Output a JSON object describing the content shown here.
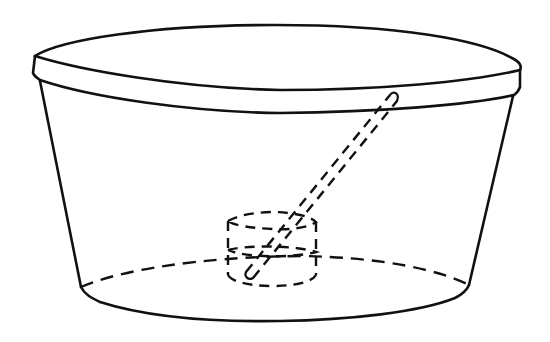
{
  "figure": {
    "description": "Line drawing of a transparent tapered tub with a lid, a small cylinder resting on the bottom, and a rod leaning diagonally from the cylinder up to the rim",
    "colors": {
      "background": "#ffffff",
      "stroke": "#111111"
    },
    "components": [
      {
        "name": "lid",
        "style": "solid"
      },
      {
        "name": "tub-walls",
        "style": "solid"
      },
      {
        "name": "tub-bottom-front",
        "style": "solid"
      },
      {
        "name": "tub-bottom-back",
        "style": "dashed"
      },
      {
        "name": "inner-cylinder",
        "style": "dashed"
      },
      {
        "name": "rod",
        "style": "dashed"
      }
    ]
  }
}
